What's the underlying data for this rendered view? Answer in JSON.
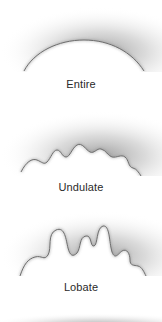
{
  "panels": [
    {
      "label": "Entire",
      "shape": "entire",
      "edge_path": "M24 71 C 34 52, 58 40, 84 40 C 110 40, 132 52, 144 71",
      "label_top": 78
    },
    {
      "label": "Undulate",
      "shape": "undulate",
      "edge_path": "M21 68 C 26 58, 32 54, 37 56 C 42 58, 44 61, 47 58 C 51 54, 53 46, 57 46 C 61 46, 62 53, 66 53 C 70 53, 72 44, 77 41 C 82 38, 86 46, 90 48 C 94 50, 97 44, 101 45 C 106 46, 108 52, 112 53 C 117 54, 121 50, 125 53 C 129 56, 128 63, 133 64 C 137 65, 139 69, 141 72",
      "label_top": 80
    },
    {
      "label": "Lobate",
      "shape": "lobate",
      "edge_path": "M20 72 C 24 60, 28 55, 35 53 C 42 51, 44 57, 48 51 C 52 44, 47 30, 56 26 C 65 22, 66 36, 68 44 C 70 52, 73 53, 77 49 C 81 44, 79 33, 86 32 C 92 31, 90 43, 94 42 C 98 41, 96 24, 103 22 C 110 21, 109 38, 112 48 C 115 56, 118 50, 122 47 C 127 44, 130 50, 130 56 C 130 62, 134 61, 138 62 C 142 63, 144 68, 146 72",
      "label_top": 77
    }
  ],
  "colors": {
    "background": "#ffffff",
    "halo": "#9a9a9a",
    "edge": "#6e6e6e",
    "label": "#2a2a2a"
  }
}
